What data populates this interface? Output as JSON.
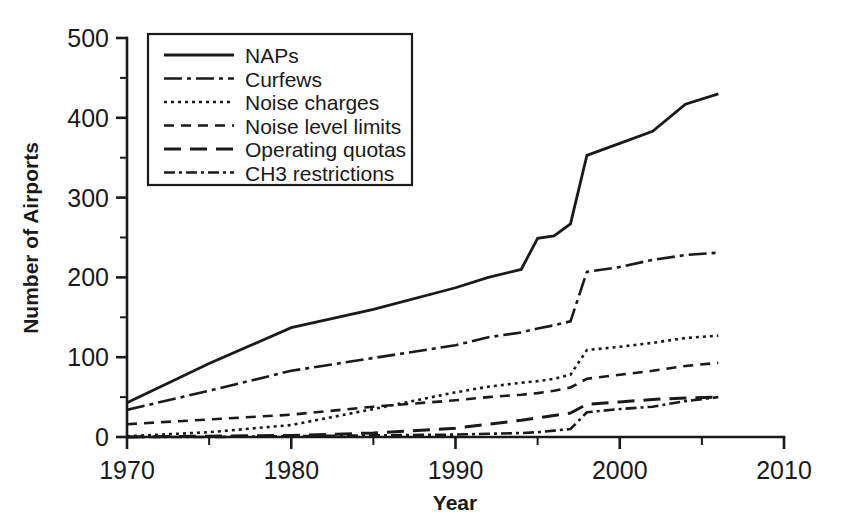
{
  "chart_data": {
    "type": "line",
    "title": "",
    "xlabel": "Year",
    "ylabel": "Number of Airports",
    "xlim": [
      1970,
      2010
    ],
    "ylim": [
      0,
      500
    ],
    "grid": false,
    "legend_position": "upper-left-inside",
    "x_ticks": [
      "1970",
      "1980",
      "1990",
      "2000",
      "2010"
    ],
    "x_tick_values": [
      1970,
      1980,
      1990,
      2000,
      2010
    ],
    "x_minor_tick_values": [
      1975,
      1985,
      1995,
      2005
    ],
    "y_ticks": [
      "0",
      "100",
      "200",
      "300",
      "400",
      "500"
    ],
    "y_tick_values": [
      0,
      100,
      200,
      300,
      400,
      500
    ],
    "y_minor_tick_values": [
      50,
      150,
      250,
      350,
      450
    ],
    "x": [
      1970,
      1975,
      1980,
      1985,
      1990,
      1992,
      1994,
      1995,
      1996,
      1997,
      1998,
      2000,
      2002,
      2004,
      2006
    ],
    "series": [
      {
        "name": "NAPs",
        "dash": "solid",
        "values": [
          43,
          92,
          137,
          160,
          187,
          200,
          210,
          249,
          252,
          267,
          353,
          368,
          383,
          417,
          430
        ]
      },
      {
        "name": "Curfews",
        "dash": "dash-dot-long",
        "values": [
          34,
          58,
          83,
          99,
          115,
          125,
          131,
          136,
          140,
          145,
          207,
          213,
          222,
          228,
          231
        ]
      },
      {
        "name": "Noise charges",
        "dash": "dotted",
        "values": [
          1,
          6,
          15,
          35,
          56,
          63,
          68,
          70,
          73,
          78,
          109,
          113,
          118,
          124,
          127
        ]
      },
      {
        "name": "Noise level limits",
        "dash": "dashed",
        "values": [
          16,
          22,
          28,
          38,
          46,
          50,
          53,
          55,
          58,
          62,
          73,
          78,
          83,
          89,
          93
        ]
      },
      {
        "name": "Operating quotas",
        "dash": "dash-long",
        "values": [
          0,
          1,
          2,
          5,
          11,
          16,
          21,
          24,
          27,
          30,
          41,
          44,
          47,
          49,
          50
        ]
      },
      {
        "name": "CH3 restrictions",
        "dash": "dash-dot",
        "values": [
          0,
          0,
          1,
          2,
          3,
          4,
          5,
          6,
          8,
          10,
          31,
          35,
          38,
          45,
          50
        ]
      }
    ]
  },
  "legend": {
    "entries": [
      {
        "label": "NAPs",
        "dash": "solid"
      },
      {
        "label": "Curfews",
        "dash": "dash-dot-long"
      },
      {
        "label": "Noise charges",
        "dash": "dotted"
      },
      {
        "label": "Noise level limits",
        "dash": "dashed"
      },
      {
        "label": "Operating quotas",
        "dash": "dash-long"
      },
      {
        "label": "CH3 restrictions",
        "dash": "dash-dot"
      }
    ]
  },
  "colors": {
    "ink": "#1a1a1a",
    "background": "#ffffff"
  }
}
